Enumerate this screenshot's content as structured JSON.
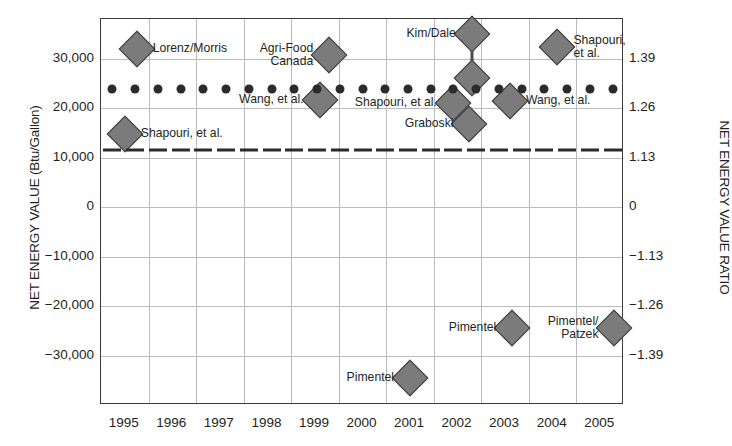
{
  "chart_data": {
    "type": "scatter",
    "title": "",
    "xlabel": "",
    "ylabel": "NET ENERGY VALUE (Btu/Gallon)",
    "ylabel_right": "NET ENERGY VALUE RATIO",
    "xlim": [
      1994.5,
      2005.5
    ],
    "ylim": [
      -40000,
      38000
    ],
    "grid": true,
    "legend": "none",
    "categories": [
      "1995",
      "1996",
      "1997",
      "1998",
      "1999",
      "2000",
      "2001",
      "2002",
      "2003",
      "2004",
      "2005"
    ],
    "yticks": [
      30000,
      20000,
      10000,
      0,
      -10000,
      -20000,
      -30000
    ],
    "ytick_labels": [
      "30,000",
      "20,000",
      "10,000",
      "0",
      "−10,000",
      "−20,000",
      "−30,000"
    ],
    "yticks_right_labels": [
      "1.39",
      "1.26",
      "1.13",
      "0",
      "−1.13",
      "−1.26",
      "−1.39"
    ],
    "yticks_right_values": [
      30000,
      20000,
      10000,
      0,
      -10000,
      -20000,
      -30000
    ],
    "series": [
      {
        "name": "Studies (diamonds)",
        "marker": "diamond",
        "points": [
          {
            "label": "Shapouri, et al.",
            "label_side": "right",
            "x": 1995.0,
            "y": 14700
          },
          {
            "label": "Lorenz/Morris",
            "label_side": "right",
            "x": 1995.25,
            "y": 32000
          },
          {
            "label": "Wang, et al.",
            "label_side": "left",
            "x": 1999.1,
            "y": 21600
          },
          {
            "label": "Agri-Food\nCanada",
            "label_side": "left",
            "x": 1999.3,
            "y": 30700
          },
          {
            "label": "Kim/Dale",
            "label_side": "left",
            "x": 2002.3,
            "y": 35000
          },
          {
            "label": "",
            "label_side": "none",
            "x": 2002.3,
            "y": 26000
          },
          {
            "label": "Shapouri, et al.",
            "label_side": "left",
            "x": 2001.9,
            "y": 21000
          },
          {
            "label": "Graboski",
            "label_side": "left",
            "x": 2002.25,
            "y": 16800
          },
          {
            "label": "Wang, et al.",
            "label_side": "right",
            "x": 2003.1,
            "y": 21500
          },
          {
            "label": "Shapouri,\net al.",
            "label_side": "right",
            "x": 2004.1,
            "y": 32300
          },
          {
            "label": "Pimentel",
            "label_side": "left",
            "x": 2001.0,
            "y": -34500
          },
          {
            "label": "Pimentel",
            "label_side": "left",
            "x": 2003.15,
            "y": -24500
          },
          {
            "label": "Pimentel/\nPatzek",
            "label_side": "left",
            "x": 2005.3,
            "y": -24500
          }
        ]
      },
      {
        "name": "Reference level (dotted)",
        "marker": "dot",
        "y": 23800,
        "note": "horizontal dotted reference row of round markers spanning all years"
      },
      {
        "name": "Reference level (dashed)",
        "marker": "dash",
        "y": 11500,
        "note": "horizontal dashed reference line spanning all years"
      }
    ]
  },
  "axes": {
    "left_title": "NET ENERGY VALUE (Btu/Gallon)",
    "right_title": "NET ENERGY VALUE RATIO"
  }
}
